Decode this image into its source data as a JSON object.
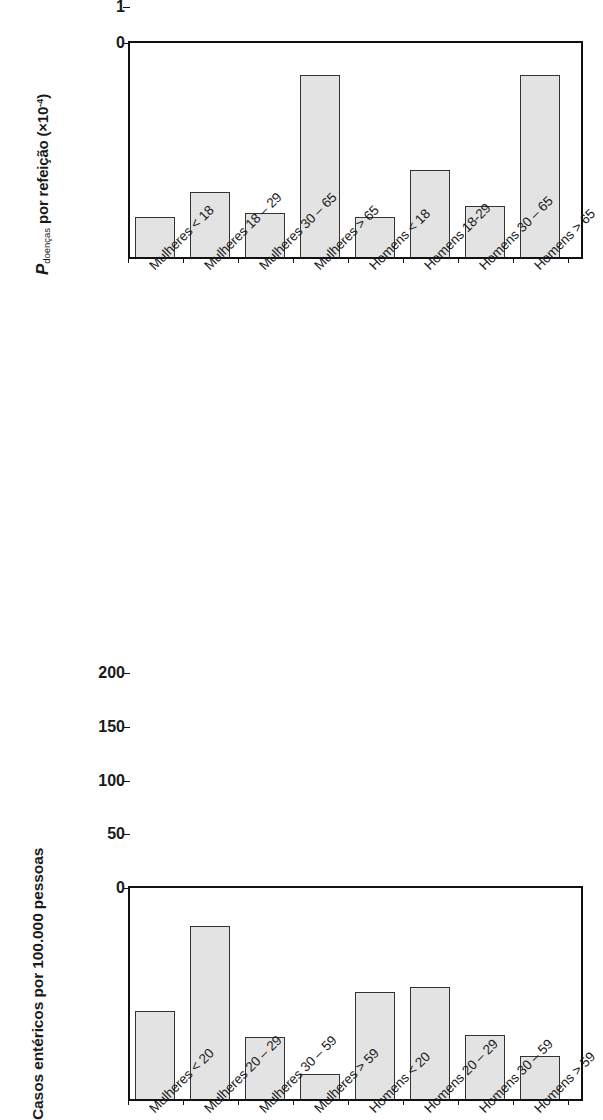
{
  "chart_data": [
    {
      "id": "top",
      "type": "bar",
      "title": "",
      "ylabel_parts": {
        "variable": "P",
        "subscript": "doenças",
        "rest": " por refeição (×10",
        "exponent": "-4",
        "close": ")"
      },
      "ylabel": "P doenças por refeição (×10-4)",
      "xlabel": "",
      "ylim": [
        0,
        6
      ],
      "yticks": [
        0,
        1,
        2,
        3,
        4,
        5,
        6
      ],
      "ytick_labels": [
        "0",
        "1",
        "2",
        "3",
        "4",
        "5",
        "6"
      ],
      "grid": false,
      "legend": "none",
      "categories": [
        "Mulheres < 18",
        "Mulheres 18 – 29",
        "Mulheres 30 – 65",
        "Mulheres > 65",
        "Homens < 18",
        "Homens 18-29",
        "Homens 30 – 65",
        "Homens > 65"
      ],
      "values": [
        1.1,
        1.8,
        1.2,
        5.0,
        1.1,
        2.4,
        1.4,
        5.0
      ]
    },
    {
      "id": "bottom",
      "type": "bar",
      "title": "",
      "ylabel": "Casos entéricos por 100.000 pessoas",
      "xlabel": "",
      "ylim": [
        0,
        200
      ],
      "yticks": [
        0,
        50,
        100,
        150,
        200
      ],
      "ytick_labels": [
        "0",
        "50",
        "100",
        "150",
        "200"
      ],
      "grid": false,
      "legend": "none",
      "categories": [
        "Mulheres < 20",
        "Mulheres 20 – 29",
        "Mulheres 30 – 59",
        "Mulheres > 59",
        "Homens < 20",
        "Homens 20 – 29",
        "Homens 30 – 59",
        "Homens > 59"
      ],
      "values": [
        82,
        161,
        58,
        23,
        100,
        104,
        60,
        40
      ]
    }
  ],
  "style": {
    "bar_fill": "#e3e3e3",
    "bar_stroke": "#333333",
    "frame_color": "#111111",
    "background": "#ffffff",
    "text_color": "#1a1a1a"
  }
}
